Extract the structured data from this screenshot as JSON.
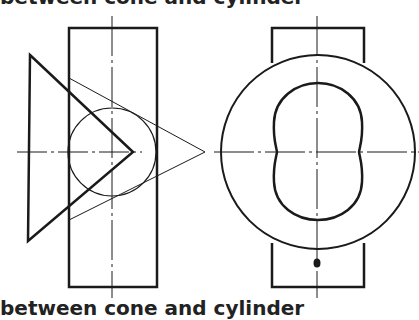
{
  "captions": {
    "top": "between cone and cylinder",
    "bottom": "between cone and cylinder"
  },
  "figure": {
    "views": [
      {
        "name": "front-view",
        "elements": [
          "cylinder-rectangle",
          "cone-triangle",
          "sphere-circle",
          "center-lines"
        ]
      },
      {
        "name": "side-view",
        "elements": [
          "cylinder-rectangle",
          "outer-circle",
          "intersection-curve",
          "center-lines",
          "apex-point"
        ]
      }
    ],
    "colors": {
      "line": "#1a1a1a",
      "background": "#ffffff"
    }
  }
}
